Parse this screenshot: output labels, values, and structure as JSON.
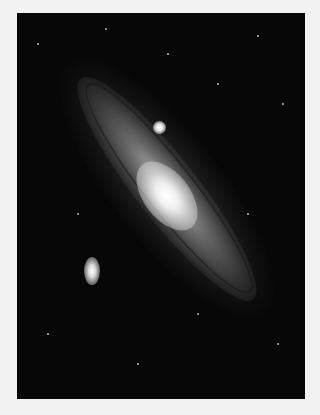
{
  "image": {
    "subject": "Andromeda galaxy photograph",
    "background_color": "#f2f2f2",
    "sky_color": "#070707",
    "features": {
      "galaxy_disk": "galaxy-disk",
      "galaxy_core": "galaxy-core",
      "satellite_upper": "satellite-galaxy-m32",
      "satellite_lower": "satellite-galaxy-m110"
    }
  }
}
